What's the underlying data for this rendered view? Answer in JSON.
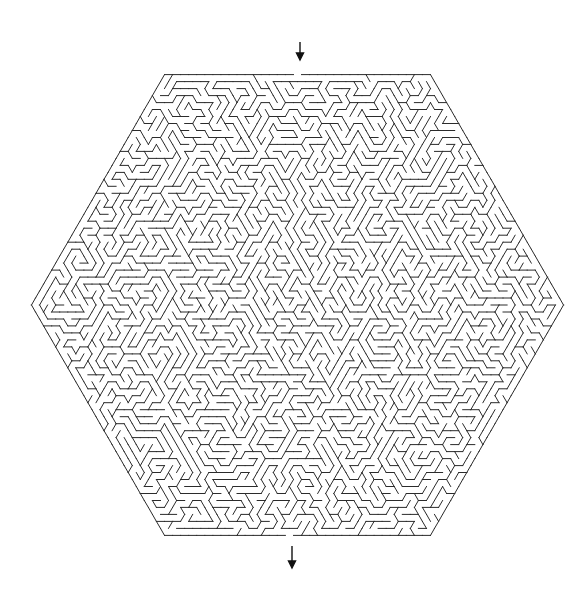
{
  "puzzle": {
    "type": "hexagonal-maze",
    "entrance_label": "start",
    "exit_label": "finish",
    "entrance_arrow": {
      "x": 300,
      "y1": 42,
      "y2": 60,
      "direction": "down"
    },
    "exit_arrow": {
      "x": 292,
      "y1": 546,
      "y2": 568,
      "direction": "down"
    },
    "hexagon": {
      "vertices": [
        [
          165,
          69
        ],
        [
          432,
          69
        ],
        [
          562,
          305
        ],
        [
          431,
          541
        ],
        [
          163,
          540
        ],
        [
          33,
          302
        ]
      ]
    },
    "colors": {
      "wall": "#2b2b2b",
      "background": "#ffffff",
      "arrow": "#111111"
    }
  }
}
